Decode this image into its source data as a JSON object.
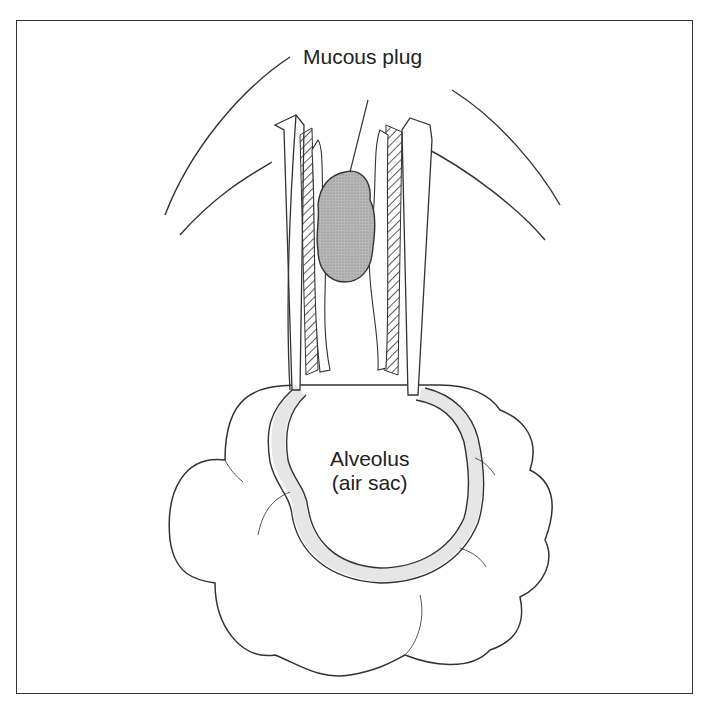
{
  "labels": {
    "mucous_plug": "Mucous plug",
    "alveolus_line1": "Alveolus",
    "alveolus_line2": "(air sac)"
  },
  "colors": {
    "line": "#333333",
    "plug_fill": "#a9a9a9",
    "background": "#ffffff"
  }
}
